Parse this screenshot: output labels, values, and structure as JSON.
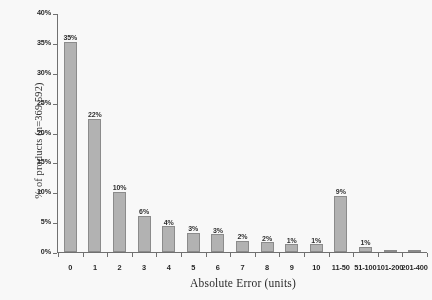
{
  "chart_data": {
    "type": "bar",
    "title": "",
    "xlabel": "Absolute Error (units)",
    "ylabel": "% of products (n=369,592)",
    "categories": [
      "0",
      "1",
      "2",
      "3",
      "4",
      "5",
      "6",
      "7",
      "8",
      "9",
      "10",
      "11-50",
      "51-100",
      "101-200",
      "201-400"
    ],
    "values": [
      35.2,
      22.3,
      10.1,
      6.1,
      4.3,
      3.2,
      3.0,
      1.9,
      1.6,
      1.3,
      1.3,
      9.4,
      0.9,
      0.25,
      0.12
    ],
    "data_labels": [
      "35%",
      "22%",
      "10%",
      "6%",
      "4%",
      "3%",
      "3%",
      "2%",
      "2%",
      "1%",
      "1%",
      "9%",
      "1%",
      "",
      ""
    ],
    "ylim": [
      0,
      40
    ],
    "ytick_values": [
      0,
      5,
      10,
      15,
      20,
      25,
      30,
      35,
      40
    ],
    "ytick_labels": [
      "0%",
      "5%",
      "10%",
      "15%",
      "20%",
      "25%",
      "30%",
      "35%",
      "40%"
    ],
    "grid": false,
    "legend": false,
    "bar_color": "#b3b3b3",
    "bar_border_color": "#8a8a8a",
    "axis_color": "#6e6e6e"
  }
}
